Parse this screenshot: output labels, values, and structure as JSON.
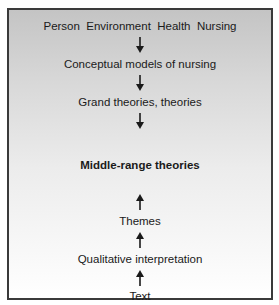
{
  "diagram": {
    "top_concepts": "Person  Environment  Health  Nursing",
    "levels": [
      {
        "label": "Conceptual models of nursing"
      },
      {
        "label": "Grand theories, theories"
      },
      {
        "label": "Middle-range theories"
      },
      {
        "label": "Themes"
      },
      {
        "label": "Qualitative interpretation"
      },
      {
        "label": "Text"
      }
    ],
    "arrows": [
      {
        "direction": "down"
      },
      {
        "direction": "down"
      },
      {
        "direction": "down"
      },
      {
        "direction": "up"
      },
      {
        "direction": "up"
      },
      {
        "direction": "up"
      }
    ],
    "colors": {
      "border": "#3a3a3a",
      "gradient_top": "#c4c4c4",
      "gradient_bottom": "#ffffff",
      "text": "#1a1a1a"
    }
  }
}
